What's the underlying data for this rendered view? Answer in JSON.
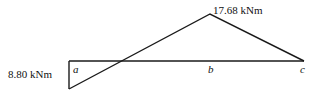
{
  "diagram": {
    "type": "bending-moment-diagram",
    "labels": {
      "max_positive": "17.68 kNm",
      "max_negative": "8.80 kNm",
      "point_a": "a",
      "point_b": "b",
      "point_c": "c"
    },
    "values": {
      "moment_at_a": -8.8,
      "moment_peak": 17.68,
      "moment_at_c": 0,
      "unit": "kNm"
    },
    "colors": {
      "line": "#1a1a1a",
      "text": "#111111"
    }
  }
}
